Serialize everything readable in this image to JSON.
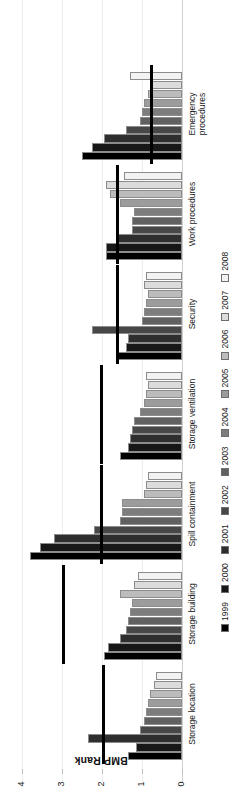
{
  "chart_data": {
    "type": "bar",
    "orientation": "horizontal",
    "title": "",
    "xlabel": "",
    "ylabel": "BMP Rank",
    "ylim": [
      0,
      4
    ],
    "yticks": [
      0,
      1,
      2,
      3,
      4
    ],
    "ytick_labels": [
      "0",
      "1",
      "2",
      "3",
      "4"
    ],
    "grid": true,
    "legend_position": "bottom",
    "categories": [
      "Storage location",
      "Storage building",
      "Spill containment",
      "Storage ventilation",
      "Security",
      "Work procedures",
      "Emergency\nprocedures"
    ],
    "series": [
      {
        "name": "1999",
        "color": "#000000",
        "values": [
          1.35,
          1.95,
          3.8,
          1.55,
          1.6,
          1.9,
          2.5
        ]
      },
      {
        "name": "2000",
        "color": "#171717",
        "values": [
          1.15,
          1.85,
          3.55,
          1.35,
          1.4,
          1.9,
          2.25
        ]
      },
      {
        "name": "2001",
        "color": "#2e2e2e",
        "values": [
          2.35,
          1.55,
          3.2,
          1.3,
          1.35,
          1.65,
          1.95
        ]
      },
      {
        "name": "2002",
        "color": "#474747",
        "values": [
          1.05,
          1.4,
          2.2,
          1.25,
          2.25,
          1.25,
          1.4
        ]
      },
      {
        "name": "2003",
        "color": "#616161",
        "values": [
          0.95,
          1.35,
          1.55,
          1.2,
          1.0,
          1.25,
          1.05
        ]
      },
      {
        "name": "2004",
        "color": "#7d7d7d",
        "values": [
          0.9,
          1.3,
          1.5,
          1.05,
          0.95,
          1.2,
          1.0
        ]
      },
      {
        "name": "2005",
        "color": "#9c9c9c",
        "values": [
          0.85,
          1.25,
          1.5,
          0.95,
          0.9,
          1.55,
          0.95
        ]
      },
      {
        "name": "2006",
        "color": "#bcbcbc",
        "values": [
          0.8,
          1.55,
          0.95,
          0.9,
          0.85,
          1.8,
          0.85
        ]
      },
      {
        "name": "2007",
        "color": "#dcdcdc",
        "values": [
          0.7,
          1.2,
          0.9,
          0.85,
          0.95,
          1.9,
          0.8
        ]
      },
      {
        "name": "2008",
        "color": "#f2f2f2",
        "values": [
          0.65,
          1.1,
          0.85,
          0.9,
          0.9,
          1.45,
          1.3
        ]
      }
    ],
    "reference_lines": {
      "label": "group mean marker",
      "color": "#000000",
      "values": [
        2.0,
        3.0,
        2.05,
        2.05,
        1.65,
        1.65,
        0.8
      ]
    }
  },
  "legend": {
    "entries": [
      "1999",
      "2000",
      "2001",
      "2002",
      "2003",
      "2004",
      "2005",
      "2006",
      "2007",
      "2008"
    ]
  },
  "axis": {
    "y_title": "BMP Rank"
  }
}
